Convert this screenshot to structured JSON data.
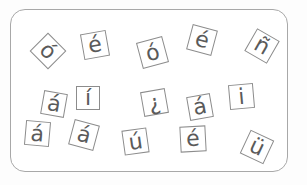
{
  "tiles": [
    {
      "char": "ó",
      "x": 48,
      "y": 51,
      "size": 26,
      "rotate": 45,
      "font": 22
    },
    {
      "char": "é",
      "x": 95,
      "y": 45,
      "size": 26,
      "rotate": -10,
      "font": 22
    },
    {
      "char": "ó",
      "x": 152,
      "y": 52,
      "size": 27,
      "rotate": -15,
      "font": 22
    },
    {
      "char": "é",
      "x": 202,
      "y": 40,
      "size": 26,
      "rotate": 15,
      "font": 22
    },
    {
      "char": "ñ",
      "x": 262,
      "y": 46,
      "size": 26,
      "rotate": 30,
      "font": 22
    },
    {
      "char": "á",
      "x": 54,
      "y": 104,
      "size": 24,
      "rotate": 10,
      "font": 22
    },
    {
      "char": "í",
      "x": 88,
      "y": 98,
      "size": 24,
      "rotate": 0,
      "font": 22
    },
    {
      "char": "¿",
      "x": 154,
      "y": 102,
      "size": 25,
      "rotate": -10,
      "font": 22
    },
    {
      "char": "á",
      "x": 200,
      "y": 107,
      "size": 24,
      "rotate": -10,
      "font": 22
    },
    {
      "char": "i",
      "x": 241,
      "y": 96,
      "size": 25,
      "rotate": -5,
      "font": 22
    },
    {
      "char": "á",
      "x": 37,
      "y": 133,
      "size": 25,
      "rotate": 5,
      "font": 22
    },
    {
      "char": "á",
      "x": 84,
      "y": 135,
      "size": 26,
      "rotate": 15,
      "font": 22
    },
    {
      "char": "ú",
      "x": 135,
      "y": 141,
      "size": 25,
      "rotate": -8,
      "font": 22
    },
    {
      "char": "é",
      "x": 193,
      "y": 139,
      "size": 26,
      "rotate": -3,
      "font": 22
    },
    {
      "char": "ü",
      "x": 257,
      "y": 147,
      "size": 26,
      "rotate": 25,
      "font": 22
    }
  ],
  "colors": {
    "border": "#8c8c8c",
    "text": "#5a5a5a",
    "frame": "#a8a8a8"
  }
}
